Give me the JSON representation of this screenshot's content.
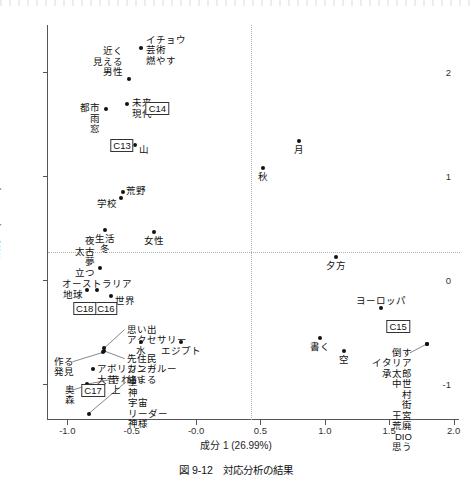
{
  "figure": {
    "caption": "図 9-12　対応分析の結果",
    "scan_artifact": true
  },
  "chart_data": {
    "type": "scatter",
    "title": "",
    "xlabel": "成分 1 (26.99%)",
    "ylabel": "成分 2 (22.62%)",
    "xlim": [
      -1.15,
      2.05
    ],
    "ylim": [
      -1.35,
      2.45
    ],
    "xticks": [
      -1.0,
      -0.5,
      -0.0,
      0.5,
      1.0,
      1.5,
      2.0
    ],
    "xticklabels": [
      "-1.0",
      "-0.5",
      "-0.0",
      "0.5",
      "1.0",
      "1.5",
      "2.0"
    ],
    "yticks": [
      -1,
      0,
      1,
      2
    ],
    "yticklabels": [
      "-1",
      "0",
      "1",
      "2"
    ],
    "grid": "dotted-zero-lines",
    "legend": "none",
    "points": [
      {
        "id": "p-geijutsu",
        "x": -0.43,
        "y": 2.23,
        "label": "イチョウ\n芸術\n燃やす",
        "align": "left",
        "dx": 5,
        "dy": -13
      },
      {
        "id": "p-dansei",
        "x": -0.52,
        "y": 1.93,
        "label": "近く\n見える\n男性",
        "align": "right",
        "dx": -6,
        "dy": -33
      },
      {
        "id": "p-mirai",
        "x": -0.54,
        "y": 1.69,
        "label": "未来\n現代",
        "align": "left",
        "dx": 5,
        "dy": -6
      },
      {
        "id": "p-toshi",
        "x": -0.7,
        "y": 1.64,
        "label": "都市\n雨\n窓",
        "align": "right",
        "dx": -6,
        "dy": -6
      },
      {
        "id": "p-yama",
        "x": -0.475,
        "y": 1.3,
        "label": "山",
        "align": "left",
        "dx": 4,
        "dy": 0
      },
      {
        "id": "p-tsuki",
        "x": 0.8,
        "y": 1.33,
        "label": "月",
        "align": "center",
        "dx": 0,
        "dy": 4
      },
      {
        "id": "p-aki",
        "x": 0.52,
        "y": 1.075,
        "label": "秋",
        "align": "center",
        "dx": 0,
        "dy": 4
      },
      {
        "id": "p-kouya",
        "x": -0.565,
        "y": 0.845,
        "label": "荒野",
        "align": "left",
        "dx": 3,
        "dy": -6
      },
      {
        "id": "p-gakkou",
        "x": -0.58,
        "y": 0.785,
        "label": "学校",
        "align": "right",
        "dx": -4,
        "dy": 1
      },
      {
        "id": "p-seikatsu",
        "x": -0.705,
        "y": 0.48,
        "label": "生活\n冬",
        "align": "center",
        "dx": 0,
        "dy": 4
      },
      {
        "id": "p-josei",
        "x": -0.33,
        "y": 0.46,
        "label": "女性",
        "align": "center",
        "dx": 0,
        "dy": 4
      },
      {
        "id": "p-tatsu",
        "x": -0.745,
        "y": 0.11,
        "label": "夜\n太古\n夢\n立つ",
        "align": "right",
        "dx": -5,
        "dy": -32
      },
      {
        "id": "p-chikyuu",
        "x": -0.845,
        "y": -0.095,
        "label": "地球",
        "align": "right",
        "dx": -4,
        "dy": 0
      },
      {
        "id": "p-australia",
        "x": -0.77,
        "y": -0.095,
        "label": "オーストラリア",
        "align": "center",
        "dx": 6,
        "dy": -11
      },
      {
        "id": "p-sekai",
        "x": -0.66,
        "y": -0.16,
        "label": "世界",
        "align": "left",
        "dx": 4,
        "dy": 0
      },
      {
        "id": "p-yuugata",
        "x": 1.09,
        "y": 0.22,
        "label": "夕方",
        "align": "center",
        "dx": 0,
        "dy": 4
      },
      {
        "id": "p-europe",
        "x": 1.44,
        "y": -0.27,
        "label": "ヨーロッパ",
        "align": "center",
        "dx": 0,
        "dy": -12
      },
      {
        "id": "p-mizu",
        "x": -0.43,
        "y": -0.595,
        "label": "水",
        "align": "center",
        "dx": 0,
        "dy": 4
      },
      {
        "id": "p-egypt",
        "x": -0.12,
        "y": -0.595,
        "label": "エジプト",
        "align": "center",
        "dx": 0,
        "dy": 4
      },
      {
        "id": "p-kaku",
        "x": 0.96,
        "y": -0.56,
        "label": "書く",
        "align": "center",
        "dx": 0,
        "dy": 4
      },
      {
        "id": "p-sora",
        "x": 1.15,
        "y": -0.69,
        "label": "空",
        "align": "center",
        "dx": 0,
        "dy": 4
      },
      {
        "id": "p-italia",
        "x": 1.79,
        "y": -0.62,
        "label": "",
        "align": "left",
        "dx": 0,
        "dy": 0
      },
      {
        "id": "p-aborigine",
        "x": -0.8,
        "y": -0.86,
        "label": "アボリジニー\n大昔",
        "align": "left",
        "dx": 4,
        "dy": -5
      }
    ],
    "cluster_labels": [
      {
        "id": "c13",
        "label": "C13",
        "x": -0.575,
        "y": 1.285
      },
      {
        "id": "c14",
        "label": "C14",
        "x": -0.3,
        "y": 1.645
      },
      {
        "id": "c15",
        "label": "C15",
        "x": 1.57,
        "y": -0.46
      },
      {
        "id": "c16",
        "label": "C16",
        "x": -0.7,
        "y": -0.285
      },
      {
        "id": "c17",
        "label": "C17",
        "x": -0.8,
        "y": -1.075
      },
      {
        "id": "c18",
        "label": "C18",
        "x": -0.865,
        "y": -0.285
      }
    ],
    "annotation_groups": [
      {
        "id": "g-omoide",
        "label": "思い出\nアクセサリー",
        "anchor_x": -0.715,
        "anchor_y": -0.66,
        "text_x": -0.555,
        "text_y": -0.48
      },
      {
        "id": "g-senjuumin",
        "label": "先住民\nカンガルー\n絡まる",
        "anchor_x": -0.715,
        "anchor_y": -0.685,
        "text_x": -0.555,
        "text_y": -0.76
      },
      {
        "id": "g-tsukuru",
        "label": "作る\n発見",
        "anchor_x": -0.725,
        "anchor_y": -0.7,
        "text_x": -0.96,
        "text_y": -0.79
      },
      {
        "id": "g-kirei",
        "label": "きれい\n上",
        "anchor_x": -0.845,
        "anchor_y": -1.005,
        "text_x": -0.68,
        "text_y": -0.965
      },
      {
        "id": "g-okumori",
        "label": "奥\n森",
        "anchor_x": -0.85,
        "anchor_y": -1.02,
        "text_x": -0.955,
        "text_y": -1.06
      },
      {
        "id": "g-hoshi",
        "label": "星\n神\n宇宙\nリーダー\n神様",
        "anchor_x": -0.835,
        "anchor_y": -1.29,
        "text_x": -0.545,
        "text_y": -0.985
      },
      {
        "id": "g-italia",
        "label": "倒す\nイタリア\n承太郎\n中世\n村\n街\n王宮\n荒廃\nDIO\n思う",
        "anchor_x": 1.79,
        "anchor_y": -0.62,
        "text_x": 1.66,
        "text_y": -0.705
      }
    ]
  }
}
